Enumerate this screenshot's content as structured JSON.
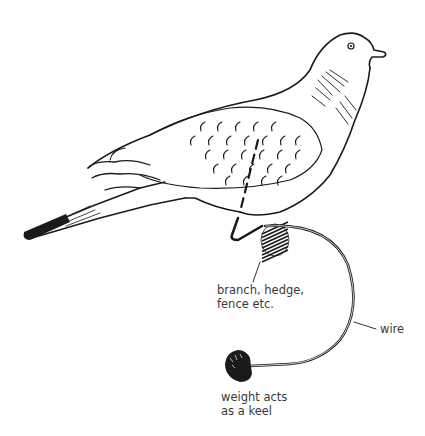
{
  "diagram": {
    "labels": {
      "branch": [
        "branch, hedge,",
        "fence etc."
      ],
      "wire": "wire",
      "weight": [
        "weight acts",
        "as a keel"
      ]
    },
    "colors": {
      "ink": "#1a1a1a",
      "label_text": "#3a3a3a",
      "background": "#ffffff"
    }
  }
}
